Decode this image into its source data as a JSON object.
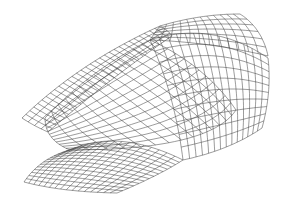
{
  "figure": {
    "kind": "3d-wireframe-shell-surface",
    "background": "#ffffff",
    "line_color": "#4a4a4a",
    "width": 286,
    "height": 206
  },
  "patches": [
    {
      "name": "front-left-vault",
      "corners": [
        [
          70,
          150
        ],
        [
          183,
          160
        ],
        [
          117,
          193
        ],
        [
          24,
          182
        ]
      ],
      "bulge": [
        [
          118,
          128
        ],
        [
          158,
          176
        ],
        [
          62,
          192
        ],
        [
          40,
          158
        ]
      ],
      "u": 16,
      "v": 14
    },
    {
      "name": "central-dome",
      "corners": [
        [
          45,
          118
        ],
        [
          150,
          40
        ],
        [
          236,
          110
        ],
        [
          70,
          150
        ]
      ],
      "bulge": [
        [
          90,
          70
        ],
        [
          205,
          65
        ],
        [
          210,
          150
        ],
        [
          45,
          140
        ]
      ],
      "u": 14,
      "v": 12
    },
    {
      "name": "right-wing",
      "corners": [
        [
          150,
          40
        ],
        [
          268,
          58
        ],
        [
          262,
          128
        ],
        [
          183,
          160
        ]
      ],
      "bulge": [
        [
          212,
          20
        ],
        [
          272,
          92
        ],
        [
          230,
          150
        ],
        [
          175,
          95
        ]
      ],
      "u": 14,
      "v": 10
    },
    {
      "name": "back-ridge",
      "corners": [
        [
          22,
          118
        ],
        [
          160,
          26
        ],
        [
          172,
          36
        ],
        [
          48,
          132
        ]
      ],
      "bulge": [
        [
          80,
          62
        ],
        [
          168,
          30
        ],
        [
          110,
          78
        ],
        [
          34,
          126
        ]
      ],
      "u": 30,
      "v": 4,
      "dense": true
    },
    {
      "name": "top-right-crown",
      "corners": [
        [
          160,
          26
        ],
        [
          240,
          14
        ],
        [
          268,
          56
        ],
        [
          150,
          40
        ]
      ],
      "bulge": [
        [
          200,
          14
        ],
        [
          262,
          28
        ],
        [
          210,
          42
        ],
        [
          155,
          32
        ]
      ],
      "u": 12,
      "v": 6
    }
  ]
}
